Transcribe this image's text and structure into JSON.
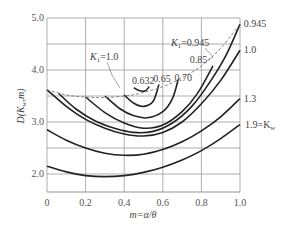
{
  "chart_data": {
    "type": "line",
    "title": "",
    "xlabel": "m=α/θ",
    "ylabel": "D(K_w,m)",
    "xlim": [
      0,
      1.0
    ],
    "ylim": [
      1.65,
      5.0
    ],
    "x_ticks": [
      "0",
      "0.2",
      "0.4",
      "0.6",
      "0.8",
      "1.0"
    ],
    "y_ticks": [
      "2.0",
      "3.0",
      "4.0",
      "5.0"
    ],
    "grid": true,
    "series": [
      {
        "name": "K_w=1.9",
        "label": "1.9=K_w",
        "style": "solid",
        "x": [
          0,
          0.1,
          0.2,
          0.3,
          0.4,
          0.5,
          0.6,
          0.7,
          0.8,
          0.9,
          1.0
        ],
        "y": [
          2.15,
          2.04,
          1.97,
          1.95,
          1.97,
          2.03,
          2.13,
          2.27,
          2.45,
          2.68,
          2.95
        ]
      },
      {
        "name": "K_w=1.3",
        "label": "1.3",
        "style": "solid",
        "x": [
          0,
          0.1,
          0.2,
          0.3,
          0.4,
          0.5,
          0.6,
          0.7,
          0.8,
          0.9,
          1.0
        ],
        "y": [
          2.85,
          2.65,
          2.5,
          2.4,
          2.36,
          2.38,
          2.47,
          2.62,
          2.83,
          3.1,
          3.45
        ]
      },
      {
        "name": "K_w=1.0",
        "label": "1.0",
        "style": "solid",
        "x": [
          0,
          0.1,
          0.2,
          0.3,
          0.4,
          0.5,
          0.6,
          0.7,
          0.8,
          0.9,
          1.0
        ],
        "y": [
          3.62,
          3.3,
          3.05,
          2.88,
          2.77,
          2.73,
          2.8,
          3.0,
          3.35,
          3.8,
          4.38
        ]
      },
      {
        "name": "K_w=0.945",
        "label": "0.945",
        "style": "solid",
        "x": [
          0.06,
          0.15,
          0.25,
          0.35,
          0.45,
          0.55,
          0.65,
          0.75,
          0.85,
          0.93,
          1.0
        ],
        "y": [
          3.55,
          3.25,
          3.02,
          2.88,
          2.8,
          2.82,
          2.98,
          3.3,
          3.8,
          4.3,
          4.88
        ]
      },
      {
        "name": "K_w=0.85",
        "label": "0.85",
        "style": "solid",
        "x": [
          0.2,
          0.3,
          0.4,
          0.5,
          0.6,
          0.7,
          0.78,
          0.86
        ],
        "y": [
          3.48,
          3.18,
          2.98,
          2.88,
          2.94,
          3.2,
          3.55,
          4.08
        ]
      },
      {
        "name": "K_w=0.70",
        "label": "0.70",
        "style": "solid",
        "x": [
          0.3,
          0.38,
          0.45,
          0.52,
          0.6,
          0.65,
          0.68
        ],
        "y": [
          3.5,
          3.25,
          3.12,
          3.08,
          3.2,
          3.45,
          3.82
        ]
      },
      {
        "name": "K_w=0.65",
        "label": "0.65",
        "style": "solid",
        "x": [
          0.4,
          0.45,
          0.5,
          0.55,
          0.58
        ],
        "y": [
          3.52,
          3.36,
          3.3,
          3.4,
          3.72
        ]
      },
      {
        "name": "K_w=0.632",
        "label": "0.632",
        "style": "solid",
        "x": [
          0.45,
          0.48,
          0.51,
          0.53
        ],
        "y": [
          3.66,
          3.6,
          3.6,
          3.68
        ]
      },
      {
        "name": "K_1 boundary",
        "label": "K_1=1.0 … K_1=0.945",
        "style": "dashed",
        "x": [
          0,
          0.1,
          0.2,
          0.3,
          0.4,
          0.48,
          0.6,
          0.7,
          0.8,
          0.9,
          1.0
        ],
        "y": [
          3.62,
          3.52,
          3.48,
          3.47,
          3.5,
          3.55,
          3.68,
          3.85,
          4.08,
          4.42,
          4.88
        ]
      }
    ],
    "annotations": [
      {
        "text": "K_1=1.0",
        "x": 0.22,
        "y": 3.85
      },
      {
        "text": "K_1=0.945",
        "x": 0.7,
        "y": 4.65
      },
      {
        "text": "0.632",
        "x": 0.44,
        "y": 3.78
      },
      {
        "text": "0.65",
        "x": 0.55,
        "y": 3.82
      },
      {
        "text": "0.70",
        "x": 0.66,
        "y": 3.84
      },
      {
        "text": "0.85",
        "x": 0.74,
        "y": 4.2
      },
      {
        "text": "0.945",
        "x": 1.02,
        "y": 4.88
      },
      {
        "text": "1.0",
        "x": 1.02,
        "y": 4.38
      },
      {
        "text": "1.3",
        "x": 1.02,
        "y": 3.45
      },
      {
        "text": "1.9=K_w",
        "x": 1.02,
        "y": 2.95
      }
    ]
  },
  "labels": {
    "y_axis": "D(K",
    "y_axis_sub": "w",
    "y_axis_end": ",m)",
    "x_axis": "m=α/θ",
    "k1_left": "K",
    "k1_left_sub": "1",
    "k1_left_val": "=1.0",
    "k1_right": "K",
    "k1_right_sub": "1",
    "k1_right_val": "=0.945",
    "kw_label": "1.9=K",
    "kw_sub": "w"
  }
}
